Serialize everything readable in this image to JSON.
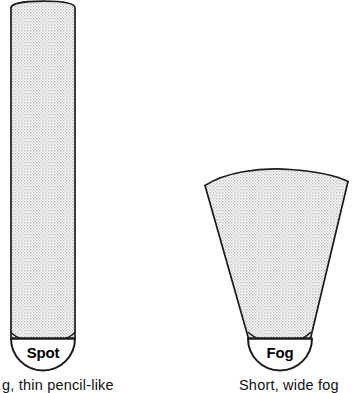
{
  "figure": {
    "type": "diagram",
    "background_color": "#ffffff",
    "outline_color": "#1a1a1a",
    "beam_fill_color": "#e8e8e8",
    "beam_pattern": "fine-stipple-dots",
    "beams": [
      {
        "id": "spot",
        "shape": "narrow-tall-column",
        "lens_label": "Spot",
        "caption": "g, thin pencil-like",
        "label_icon": "semicircle-lens",
        "top_y": 2,
        "bottom_y": 338,
        "left_x": 11,
        "right_x": 75,
        "top_width": 64,
        "bottom_width": 64
      },
      {
        "id": "fog",
        "shape": "short-wide-wedge",
        "lens_label": "Fog",
        "caption": "Short, wide fog",
        "label_icon": "semicircle-lens",
        "top_y": 178,
        "bottom_y": 338,
        "left_x": 205,
        "right_x": 348,
        "top_width": 143,
        "bottom_width": 62
      }
    ],
    "lens": {
      "radius": 32,
      "shape": "semicircle",
      "fill": "#ffffff"
    }
  }
}
